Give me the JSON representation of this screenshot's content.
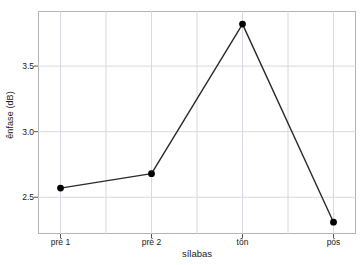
{
  "chart_data": {
    "type": "line",
    "title": "",
    "xlabel": "sílabas",
    "ylabel": "ênfase (dB)",
    "categories": [
      "pré 1",
      "pré 2",
      "tôn",
      "pós"
    ],
    "values": [
      2.57,
      2.68,
      3.82,
      2.31
    ],
    "series": [
      {
        "name": "ênfase",
        "values": [
          2.57,
          2.68,
          3.82,
          2.31
        ]
      }
    ],
    "y_ticks": [
      2.5,
      3.0,
      3.5
    ],
    "y_tick_labels": [
      "2.5",
      "3.0",
      "3.5"
    ],
    "ylim": [
      2.22,
      3.92
    ],
    "xlim": [
      0,
      5
    ],
    "grid": true,
    "grid_color": "#d8d8e0",
    "legend": "none",
    "line_color": "#2a2a2a",
    "marker": "circle",
    "marker_color": "#000000",
    "frame_color": "#b4b4b4",
    "background": "#ffffff"
  }
}
